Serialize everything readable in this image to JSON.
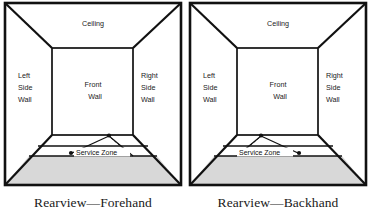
{
  "figures": [
    {
      "id": "forehand",
      "caption": "Rearview—Forehand",
      "labels": {
        "ceiling": "Ceiling",
        "left_side_wall_line1": "Left",
        "left_side_wall_line2": "Side",
        "left_side_wall_line3": "Wall",
        "front_wall_line1": "Front",
        "front_wall_line2": "Wall",
        "right_side_wall_line1": "Right",
        "right_side_wall_line2": "Side",
        "right_side_wall_line3": "Wall",
        "service_zone": "Service  Zone"
      },
      "serve_direction": "forehand"
    },
    {
      "id": "backhand",
      "caption": "Rearview—Backhand",
      "labels": {
        "ceiling": "Ceiling",
        "left_side_wall_line1": "Left",
        "left_side_wall_line2": "Side",
        "left_side_wall_line3": "Wall",
        "front_wall_line1": "Front",
        "front_wall_line2": "Wall",
        "right_side_wall_line1": "Right",
        "right_side_wall_line2": "Side",
        "right_side_wall_line3": "Wall",
        "service_zone": "Service  Zone"
      },
      "serve_direction": "backhand"
    }
  ],
  "colors": {
    "outline": "#111111",
    "floor_shade": "#d8d8d8",
    "text": "#1a1a1a",
    "background": "#ffffff"
  }
}
